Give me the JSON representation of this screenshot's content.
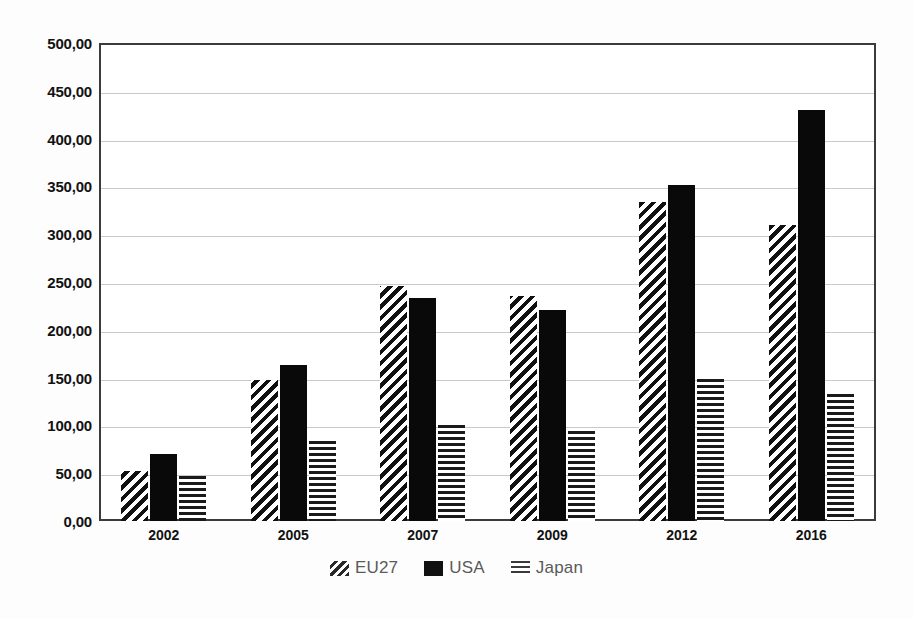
{
  "chart_data": {
    "type": "bar",
    "title": "",
    "subtitle": "",
    "xlabel": "",
    "ylabel": "",
    "categories": [
      "2002",
      "2005",
      "2007",
      "2009",
      "2012",
      "2016"
    ],
    "series": [
      {
        "name": "EU27",
        "pattern": "diagonal-hatch",
        "values": [
          52,
          147,
          246,
          235,
          334,
          310
        ]
      },
      {
        "name": "USA",
        "pattern": "solid-black",
        "values": [
          70,
          163,
          233,
          221,
          352,
          430
        ]
      },
      {
        "name": "Japan",
        "pattern": "horizontal-lines",
        "values": [
          47,
          84,
          100,
          94,
          149,
          133
        ]
      }
    ],
    "ylim": [
      0,
      500
    ],
    "ytick_step": 50,
    "ytick_labels": [
      "0,00",
      "50,00",
      "100,00",
      "150,00",
      "200,00",
      "250,00",
      "300,00",
      "350,00",
      "400,00",
      "450,00",
      "500,00"
    ],
    "ytick_values": [
      0,
      50,
      100,
      150,
      200,
      250,
      300,
      350,
      400,
      450,
      500
    ],
    "grid": true,
    "grid_axis": "y",
    "legend_position": "bottom",
    "decimal_separator": ",",
    "colors": {
      "bar_ink": "#111111",
      "frame": "#3b3b3b",
      "gridline": "#c9c9c9",
      "axis_text": "#121212",
      "legend_text": "#5a5a5a",
      "background": "#fdfdfd",
      "plot_background": "#ffffff"
    }
  },
  "legend": {
    "items": [
      {
        "label": "EU27",
        "icon": "diagonal-hatch-swatch-icon"
      },
      {
        "label": "USA",
        "icon": "solid-black-swatch-icon"
      },
      {
        "label": "Japan",
        "icon": "horizontal-lines-swatch-icon"
      }
    ]
  }
}
